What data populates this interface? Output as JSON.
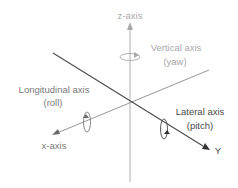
{
  "diagram": {
    "axes": [
      {
        "id": "z",
        "end_label": "z-axis",
        "name": "Vertical axis",
        "motion": "(yaw)",
        "color": "#a8a8a8"
      },
      {
        "id": "x",
        "end_label": "x-axis",
        "name": "Longitudinal axis",
        "motion": "(roll)",
        "color": "#7a7a7a"
      },
      {
        "id": "y",
        "end_label": "Y",
        "name": "Lateral axis",
        "motion": "(pitch)",
        "color": "#4a4a4a"
      }
    ]
  },
  "labels": {
    "z_axis": "z-axis",
    "vertical_axis": "Vertical axis",
    "yaw": "(yaw)",
    "longitudinal_axis": "Longitudinal axis",
    "roll": "(roll)",
    "x_axis": "x-axis",
    "lateral_axis": "Lateral axis",
    "pitch": "(pitch)",
    "y_axis": "Y"
  },
  "colors": {
    "vertical": "#a8a8a8",
    "longitudinal": "#7a7a7a",
    "lateral": "#4a4a4a",
    "background": "#ffffff"
  }
}
